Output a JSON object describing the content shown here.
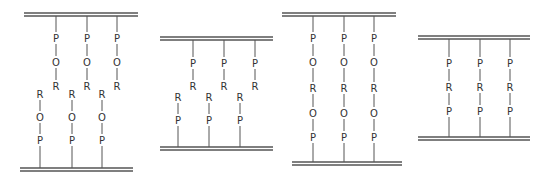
{
  "colors": {
    "line": "#555555",
    "text": "#333333",
    "background": "#ffffff"
  },
  "panels": [
    {
      "id": "panel-1",
      "description": "Two opposing monolayers: P-O-R chains from top plate interdigitate with R-O-P chains from bottom plate",
      "top_plate": {
        "x1": 24,
        "x2": 138,
        "y": 13
      },
      "bottom_plate": {
        "x1": 20,
        "x2": 133,
        "y": 168
      },
      "top_chains": [
        {
          "x": 56,
          "labels": [
            "P",
            "O",
            "R"
          ],
          "ys": [
            38,
            62,
            86
          ]
        },
        {
          "x": 87,
          "labels": [
            "P",
            "O",
            "R"
          ],
          "ys": [
            38,
            62,
            86
          ]
        },
        {
          "x": 117,
          "labels": [
            "P",
            "O",
            "R"
          ],
          "ys": [
            38,
            62,
            86
          ]
        }
      ],
      "bottom_chains": [
        {
          "x": 40,
          "labels": [
            "R",
            "O",
            "P"
          ],
          "ys": [
            94,
            117,
            140
          ]
        },
        {
          "x": 72,
          "labels": [
            "R",
            "O",
            "P"
          ],
          "ys": [
            94,
            117,
            140
          ]
        },
        {
          "x": 102,
          "labels": [
            "R",
            "O",
            "P"
          ],
          "ys": [
            94,
            117,
            140
          ]
        }
      ]
    },
    {
      "id": "panel-2",
      "description": "Two opposing monolayers: P-R chains from top plate interdigitate with R-P chains from bottom plate",
      "top_plate": {
        "x1": 160,
        "x2": 273,
        "y": 37
      },
      "bottom_plate": {
        "x1": 160,
        "x2": 273,
        "y": 147
      },
      "top_chains": [
        {
          "x": 193,
          "labels": [
            "P",
            "R"
          ],
          "ys": [
            63,
            86
          ]
        },
        {
          "x": 224,
          "labels": [
            "P",
            "R"
          ],
          "ys": [
            63,
            86
          ]
        },
        {
          "x": 255,
          "labels": [
            "P",
            "R"
          ],
          "ys": [
            63,
            86
          ]
        }
      ],
      "bottom_chains": [
        {
          "x": 178,
          "labels": [
            "R",
            "P"
          ],
          "ys": [
            97,
            120
          ]
        },
        {
          "x": 209,
          "labels": [
            "R",
            "P"
          ],
          "ys": [
            97,
            120
          ]
        },
        {
          "x": 240,
          "labels": [
            "R",
            "P"
          ],
          "ys": [
            97,
            120
          ]
        }
      ]
    },
    {
      "id": "panel-3",
      "description": "Bridging chains P-O-R-O-P spanning between two plates",
      "top_plate": {
        "x1": 282,
        "x2": 396,
        "y": 13
      },
      "bottom_plate": {
        "x1": 292,
        "x2": 402,
        "y": 162
      },
      "bridge_chains": [
        {
          "x": 313,
          "labels": [
            "P",
            "O",
            "R",
            "O",
            "P"
          ],
          "ys": [
            38,
            62,
            88,
            113,
            137
          ]
        },
        {
          "x": 344,
          "labels": [
            "P",
            "O",
            "R",
            "O",
            "P"
          ],
          "ys": [
            38,
            62,
            88,
            113,
            137
          ]
        },
        {
          "x": 374,
          "labels": [
            "P",
            "O",
            "R",
            "O",
            "P"
          ],
          "ys": [
            38,
            62,
            88,
            113,
            137
          ]
        }
      ]
    },
    {
      "id": "panel-4",
      "description": "Bridging chains P-R-P spanning between two plates",
      "top_plate": {
        "x1": 418,
        "x2": 530,
        "y": 36
      },
      "bottom_plate": {
        "x1": 418,
        "x2": 530,
        "y": 137
      },
      "bridge_chains": [
        {
          "x": 449,
          "labels": [
            "P",
            "R",
            "P"
          ],
          "ys": [
            63,
            87,
            111
          ]
        },
        {
          "x": 480,
          "labels": [
            "P",
            "R",
            "P"
          ],
          "ys": [
            63,
            87,
            111
          ]
        },
        {
          "x": 510,
          "labels": [
            "P",
            "R",
            "P"
          ],
          "ys": [
            63,
            87,
            111
          ]
        }
      ]
    }
  ]
}
